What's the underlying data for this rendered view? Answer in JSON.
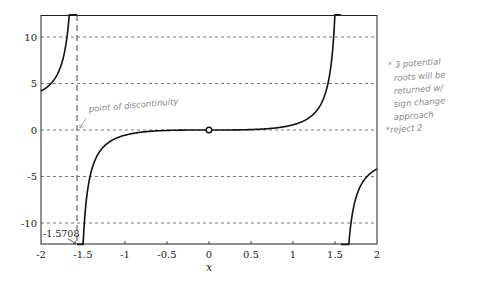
{
  "chart_data": {
    "type": "line",
    "title": "",
    "xlabel": "x",
    "ylabel": "",
    "xlim": [
      -2,
      2
    ],
    "ylim": [
      -12.3,
      12.4
    ],
    "grid": "horizontal dashed at y ticks",
    "x_ticks": [
      "-2",
      "-1.5",
      "-1",
      "-0.5",
      "0",
      "0.5",
      "1",
      "1.5",
      "2"
    ],
    "y_ticks": [
      "10",
      "5",
      "0",
      "-5",
      "-10"
    ],
    "series": [
      {
        "name": "f(x) (approx. tan(x) - x)",
        "x": [
          -2,
          -1.9,
          -1.8,
          -1.7,
          -1.65,
          -1.6,
          -1.5,
          -1.45,
          -1.4,
          -1.3,
          -1.2,
          -1.0,
          -0.5,
          0,
          0.5,
          1.0,
          1.2,
          1.3,
          1.4,
          1.45,
          1.5,
          1.6,
          1.65,
          1.7,
          1.8,
          1.9,
          2
        ],
        "values": [
          3.3,
          4.9,
          6.1,
          7.4,
          10.5,
          12.4,
          -12.3,
          -6.8,
          -4.4,
          -2.3,
          -1.4,
          -0.56,
          -0.05,
          0,
          0.05,
          0.56,
          1.4,
          2.3,
          4.4,
          6.8,
          12.4,
          -12.3,
          -10.5,
          -9.4,
          -6.1,
          -4.9,
          -3.4
        ]
      }
    ],
    "markers": [
      {
        "type": "open-circle",
        "x": 0,
        "y": 0
      }
    ],
    "vertical_lines": [
      {
        "x": -1.5708,
        "style": "dashed",
        "label": "-1.5708"
      }
    ],
    "annotations": [
      {
        "text": "point of discontinuity",
        "x": -1.5,
        "y": 1.5,
        "style": "handwritten"
      },
      {
        "text": "-1.5708",
        "x": -1.5708,
        "y": -11.3
      }
    ]
  },
  "notes": {
    "handwritten_line1": "* 3 potential",
    "handwritten_line2": "roots will be",
    "handwritten_line3": "returned w/",
    "handwritten_line4": "sign change",
    "handwritten_line5": "approach",
    "handwritten_line6": "*reject 2"
  },
  "labels": {
    "discontinuity": "point of discontinuity",
    "asymptote_value": "-1.5708",
    "x_axis_title": "x",
    "xt0": "-2",
    "xt1": "-1.5",
    "xt2": "-1",
    "xt3": "-0.5",
    "xt4": "0",
    "xt5": "0.5",
    "xt6": "1",
    "xt7": "1.5",
    "xt8": "2",
    "yt0": "10",
    "yt1": "5",
    "yt2": "0",
    "yt3": "-5",
    "yt4": "-10"
  }
}
